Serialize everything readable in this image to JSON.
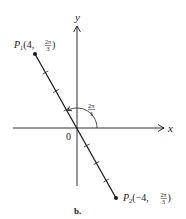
{
  "figure": {
    "caption": "b.",
    "axes": {
      "x_label": "x",
      "y_label": "y",
      "origin_label": "0"
    },
    "points": [
      {
        "name": "P",
        "subscript": "1",
        "r": "4",
        "theta_num": "2π",
        "theta_den": "3",
        "coords_text": "(4, 2π/3)"
      },
      {
        "name": "P",
        "subscript": "2",
        "r": "−4",
        "theta_num": "2π",
        "theta_den": "3",
        "coords_text": "(−4, 2π/3)"
      }
    ],
    "angle": {
      "num": "2π",
      "den": "3",
      "text": "2π/3"
    },
    "ticks_per_side": 3,
    "colors": {
      "ink": "#1a1a1a",
      "background": "#ffffff"
    }
  }
}
